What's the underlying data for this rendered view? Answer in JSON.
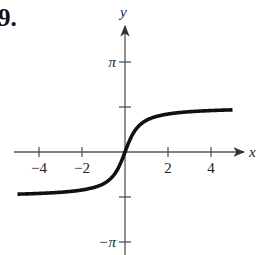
{
  "problem": {
    "number": "9."
  },
  "chart_data": {
    "type": "line",
    "title": "",
    "xlabel": "x",
    "ylabel": "y",
    "xlim": [
      -5,
      5
    ],
    "ylim": [
      -3.3,
      4.2
    ],
    "grid": false,
    "legend": null,
    "x_ticks": [
      -4,
      -2,
      2,
      4
    ],
    "x_tick_labels": [
      "−4",
      "−2",
      "2",
      "4"
    ],
    "y_ticks": [
      3.14159,
      1.5708,
      -1.5708,
      -3.14159
    ],
    "y_tick_labels": [
      "π",
      "",
      "",
      "−π"
    ],
    "series": [
      {
        "name": "curve",
        "function": "y = arctan(2x)",
        "x": [
          -5,
          -4,
          -3,
          -2,
          -1.5,
          -1,
          -0.75,
          -0.5,
          -0.25,
          0,
          0.25,
          0.5,
          0.75,
          1,
          1.5,
          2,
          3,
          4,
          5
        ],
        "y": [
          -1.471,
          -1.446,
          -1.406,
          -1.326,
          -1.249,
          -1.107,
          -0.983,
          -0.785,
          -0.464,
          0,
          0.464,
          0.785,
          0.983,
          1.107,
          1.249,
          1.326,
          1.406,
          1.446,
          1.471
        ]
      }
    ],
    "annotations": []
  },
  "colors": {
    "curve": "#111111",
    "axis": "#555555",
    "background": "#ffffff"
  }
}
